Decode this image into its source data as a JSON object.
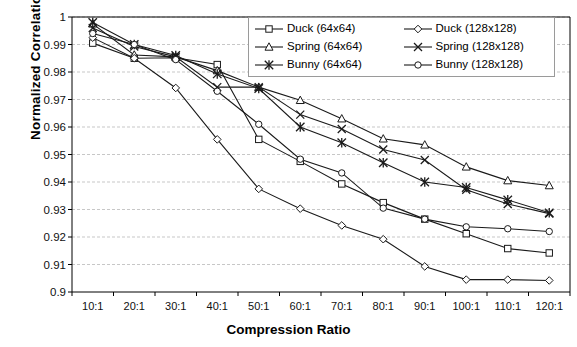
{
  "axes": {
    "ylabel": "Normalized Correlation",
    "xlabel": "Compression Ratio",
    "yticks": [
      "1",
      "0.99",
      "0.98",
      "0.97",
      "0.96",
      "0.95",
      "0.94",
      "0.93",
      "0.92",
      "0.91",
      "0.9"
    ],
    "xticks": [
      "10:1",
      "20:1",
      "30:1",
      "40:1",
      "50:1",
      "60:1",
      "70:1",
      "80:1",
      "90:1",
      "100:1",
      "110:1",
      "120:1"
    ]
  },
  "legend": {
    "items": [
      {
        "label": "Duck (64x64)",
        "marker": "square",
        "color": "#000000"
      },
      {
        "label": "Duck (128x128)",
        "marker": "diamond",
        "color": "#000000"
      },
      {
        "label": "Spring (64x64)",
        "marker": "triangle",
        "color": "#000000"
      },
      {
        "label": "Spring (128x128)",
        "marker": "x",
        "color": "#000000"
      },
      {
        "label": "Bunny (64x64)",
        "marker": "asterisk",
        "color": "#000000"
      },
      {
        "label": "Bunny (128x128)",
        "marker": "circle",
        "color": "#000000"
      }
    ]
  },
  "chart_data": {
    "type": "line",
    "title": "",
    "xlabel": "Compression Ratio",
    "ylabel": "Normalized Correlation",
    "categories": [
      "10:1",
      "20:1",
      "30:1",
      "40:1",
      "50:1",
      "60:1",
      "70:1",
      "80:1",
      "90:1",
      "100:1",
      "110:1",
      "120:1"
    ],
    "ylim": [
      0.9,
      1.0
    ],
    "ytick_step": 0.01,
    "grid": true,
    "legend_position": "top-right",
    "series": [
      {
        "name": "Duck (64x64)",
        "marker": "square",
        "values": [
          0.9905,
          0.985,
          0.9852,
          0.9827,
          0.9555,
          0.9475,
          0.9393,
          0.9325,
          0.9265,
          0.9212,
          0.9158,
          0.9142
        ]
      },
      {
        "name": "Spring (64x64)",
        "marker": "triangle",
        "values": [
          0.9975,
          0.9862,
          0.9855,
          0.9805,
          0.9745,
          0.9697,
          0.963,
          0.9557,
          0.9535,
          0.9455,
          0.9405,
          0.9387
        ]
      },
      {
        "name": "Bunny (64x64)",
        "marker": "asterisk",
        "values": [
          0.998,
          0.99,
          0.986,
          0.9793,
          0.974,
          0.96,
          0.9543,
          0.947,
          0.94,
          0.938,
          0.9335,
          0.9288
        ]
      },
      {
        "name": "Duck (128x128)",
        "marker": "diamond",
        "values": [
          0.9925,
          0.985,
          0.9742,
          0.9555,
          0.9375,
          0.9303,
          0.9242,
          0.9192,
          0.9093,
          0.9045,
          0.9045,
          0.9042
        ]
      },
      {
        "name": "Spring (128x128)",
        "marker": "x",
        "values": [
          0.996,
          0.9893,
          0.9855,
          0.9745,
          0.9745,
          0.9645,
          0.9593,
          0.9518,
          0.948,
          0.9372,
          0.932,
          0.9285
        ]
      },
      {
        "name": "Bunny (128x128)",
        "marker": "circle",
        "values": [
          0.994,
          0.99,
          0.9845,
          0.973,
          0.961,
          0.9483,
          0.9433,
          0.9305,
          0.9265,
          0.9237,
          0.923,
          0.922
        ]
      }
    ]
  }
}
